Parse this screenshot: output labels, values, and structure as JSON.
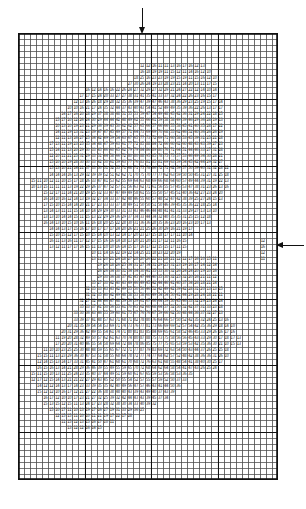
{
  "figure": {
    "background_color": "#ffffff",
    "ink_color": "#111111"
  },
  "grid": {
    "label": "mesh-grid",
    "left_px": 18,
    "top_px": 33,
    "width_px": 260,
    "height_px": 447,
    "columns": 43,
    "rows": 74,
    "cell_width_px": 6.05,
    "cell_height_px": 6.04,
    "minor_line_color": "#4a4a4a",
    "minor_line_width_px": 0.6,
    "major_line_color": "#111111",
    "major_line_width_px": 1.5,
    "major_every_columns": 11,
    "major_every_rows": 11,
    "border_color": "#111111",
    "border_width_px": 1.6
  },
  "annotations": {
    "top_arrow": {
      "name": "downward-load-arrow",
      "direction": "down",
      "label": "",
      "tip_x_px": 143,
      "tip_y_px": 35
    },
    "right_arrow": {
      "name": "leftward-load-arrow",
      "direction": "left",
      "label": "",
      "tip_x_px": 277,
      "tip_y_px": 246
    }
  },
  "chart_data": {
    "type": "heatmap",
    "title": "",
    "subtitle": "",
    "xlabel": "",
    "ylabel": "",
    "legend": [],
    "grid": true,
    "nx": 43,
    "ny": 74,
    "xlim": [
      0,
      43
    ],
    "ylim": [
      0,
      74
    ],
    "value_range": [
      10,
      99
    ],
    "value_digits": 2,
    "filled_rows": [
      {
        "row": 5,
        "start": 20,
        "end": 30
      },
      {
        "row": 6,
        "start": 20,
        "end": 31
      },
      {
        "row": 7,
        "start": 19,
        "end": 32
      },
      {
        "row": 8,
        "start": 18,
        "end": 32
      },
      {
        "row": 9,
        "start": 11,
        "end": 32
      },
      {
        "row": 10,
        "start": 10,
        "end": 32
      },
      {
        "row": 11,
        "start": 9,
        "end": 33
      },
      {
        "row": 12,
        "start": 8,
        "end": 33
      },
      {
        "row": 13,
        "start": 7,
        "end": 33
      },
      {
        "row": 14,
        "start": 6,
        "end": 33
      },
      {
        "row": 15,
        "start": 6,
        "end": 33
      },
      {
        "row": 16,
        "start": 6,
        "end": 33
      },
      {
        "row": 17,
        "start": 6,
        "end": 33
      },
      {
        "row": 18,
        "start": 5,
        "end": 33
      },
      {
        "row": 19,
        "start": 5,
        "end": 33
      },
      {
        "row": 20,
        "start": 5,
        "end": 33
      },
      {
        "row": 21,
        "start": 5,
        "end": 33
      },
      {
        "row": 22,
        "start": 5,
        "end": 34
      },
      {
        "row": 23,
        "start": 5,
        "end": 34
      },
      {
        "row": 24,
        "start": 2,
        "end": 34
      },
      {
        "row": 25,
        "start": 2,
        "end": 34
      },
      {
        "row": 26,
        "start": 4,
        "end": 33
      },
      {
        "row": 27,
        "start": 4,
        "end": 33
      },
      {
        "row": 28,
        "start": 4,
        "end": 32
      },
      {
        "row": 29,
        "start": 4,
        "end": 32
      },
      {
        "row": 30,
        "start": 4,
        "end": 31
      },
      {
        "row": 31,
        "start": 4,
        "end": 31
      },
      {
        "row": 32,
        "start": 5,
        "end": 28
      },
      {
        "row": 33,
        "start": 5,
        "end": 28
      },
      {
        "row": 34,
        "start": 5,
        "end": 27
      },
      {
        "row": 35,
        "start": 5,
        "end": 27
      },
      {
        "row": 36,
        "start": 12,
        "end": 26
      },
      {
        "row": 37,
        "start": 12,
        "end": 32
      },
      {
        "row": 38,
        "start": 13,
        "end": 32
      },
      {
        "row": 39,
        "start": 13,
        "end": 32
      },
      {
        "row": 40,
        "start": 13,
        "end": 32
      },
      {
        "row": 41,
        "start": 12,
        "end": 32
      },
      {
        "row": 42,
        "start": 11,
        "end": 33
      },
      {
        "row": 43,
        "start": 11,
        "end": 33
      },
      {
        "row": 44,
        "start": 10,
        "end": 33
      },
      {
        "row": 45,
        "start": 10,
        "end": 33
      },
      {
        "row": 46,
        "start": 9,
        "end": 33
      },
      {
        "row": 47,
        "start": 9,
        "end": 34
      },
      {
        "row": 48,
        "start": 8,
        "end": 35
      },
      {
        "row": 49,
        "start": 7,
        "end": 35
      },
      {
        "row": 50,
        "start": 6,
        "end": 36
      },
      {
        "row": 51,
        "start": 6,
        "end": 36
      },
      {
        "row": 52,
        "start": 4,
        "end": 34
      },
      {
        "row": 53,
        "start": 3,
        "end": 34
      },
      {
        "row": 54,
        "start": 3,
        "end": 33
      },
      {
        "row": 55,
        "start": 3,
        "end": 32
      },
      {
        "row": 56,
        "start": 2,
        "end": 28
      },
      {
        "row": 57,
        "start": 2,
        "end": 27
      },
      {
        "row": 58,
        "start": 3,
        "end": 26
      },
      {
        "row": 59,
        "start": 3,
        "end": 25
      },
      {
        "row": 60,
        "start": 4,
        "end": 24
      },
      {
        "row": 61,
        "start": 4,
        "end": 22
      },
      {
        "row": 62,
        "start": 5,
        "end": 20
      },
      {
        "row": 63,
        "start": 6,
        "end": 18
      },
      {
        "row": 64,
        "start": 7,
        "end": 15
      },
      {
        "row": 65,
        "start": 8,
        "end": 13
      }
    ],
    "isolated_cells": [
      {
        "row": 34,
        "col": 40
      },
      {
        "row": 35,
        "col": 40
      },
      {
        "row": 36,
        "col": 40
      },
      {
        "row": 37,
        "col": 40
      }
    ],
    "sample_values": [
      [
        11,
        12,
        13,
        14,
        15,
        16,
        17,
        18,
        19,
        21,
        22
      ],
      [
        12,
        13,
        14,
        16,
        17,
        18,
        19,
        21,
        22,
        23,
        24
      ],
      [
        13,
        15,
        16,
        17,
        19,
        21,
        22,
        24,
        25,
        26,
        27
      ],
      [
        14,
        16,
        18,
        19,
        21,
        23,
        25,
        26,
        28,
        29,
        31
      ],
      [
        15,
        17,
        19,
        21,
        23,
        25,
        27,
        29,
        31,
        32,
        34
      ],
      [
        16,
        18,
        21,
        23,
        25,
        28,
        30,
        32,
        34,
        36,
        37
      ],
      [
        17,
        19,
        22,
        25,
        28,
        31,
        33,
        36,
        38,
        40,
        41
      ],
      [
        18,
        21,
        24,
        27,
        30,
        34,
        37,
        40,
        42,
        44,
        45
      ],
      [
        19,
        22,
        25,
        29,
        33,
        37,
        41,
        44,
        47,
        49,
        50
      ],
      [
        21,
        24,
        27,
        31,
        36,
        41,
        45,
        49,
        52,
        54,
        55
      ],
      [
        22,
        25,
        29,
        34,
        39,
        44,
        49,
        53,
        57,
        59,
        61
      ]
    ]
  }
}
